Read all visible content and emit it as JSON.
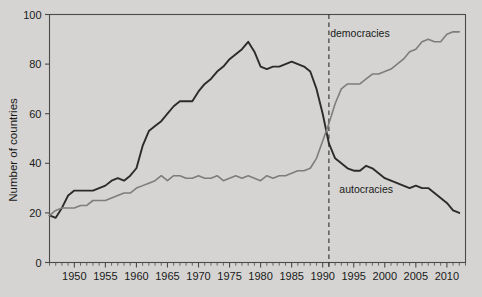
{
  "chart_data": {
    "type": "line",
    "title": "",
    "subtitle": "",
    "xlabel": "",
    "ylabel": "Number of countries",
    "xlim": [
      1946,
      2013
    ],
    "ylim": [
      0,
      100
    ],
    "grid": false,
    "legend_position": "inline-annotation",
    "y_ticks": [
      0,
      20,
      40,
      60,
      80,
      100
    ],
    "y_tick_labels": [
      "0",
      "20",
      "40",
      "60",
      "80",
      "100"
    ],
    "x_ticks": [
      1950,
      1955,
      1960,
      1965,
      1970,
      1975,
      1980,
      1985,
      1990,
      1995,
      2000,
      2005,
      2010
    ],
    "x_tick_labels": [
      "1950",
      "1955",
      "1960",
      "1965",
      "1970",
      "1975",
      "1980",
      "1985",
      "1990",
      "1995",
      "2000",
      "2005",
      "2010"
    ],
    "x_minor_tick_step": 1,
    "annotations": [
      {
        "name": "fall-of-berlin-wall-marker",
        "type": "vline",
        "x": 1991,
        "style": "dashed",
        "color": "#2b2b2b",
        "label": ""
      }
    ],
    "series": [
      {
        "name": "autocracies",
        "label": "autocracies",
        "color": "#2b2b2b",
        "label_x": 1997,
        "label_y": 28,
        "x": [
          1946,
          1947,
          1948,
          1949,
          1950,
          1951,
          1952,
          1953,
          1954,
          1955,
          1956,
          1957,
          1958,
          1959,
          1960,
          1961,
          1962,
          1963,
          1964,
          1965,
          1966,
          1967,
          1968,
          1969,
          1970,
          1971,
          1972,
          1973,
          1974,
          1975,
          1976,
          1977,
          1978,
          1979,
          1980,
          1981,
          1982,
          1983,
          1984,
          1985,
          1986,
          1987,
          1988,
          1989,
          1990,
          1991,
          1992,
          1993,
          1994,
          1995,
          1996,
          1997,
          1998,
          1999,
          2000,
          2001,
          2002,
          2003,
          2004,
          2005,
          2006,
          2007,
          2008,
          2009,
          2010,
          2011,
          2012
        ],
        "values": [
          19,
          18,
          22,
          27,
          29,
          29,
          29,
          29,
          30,
          31,
          33,
          34,
          33,
          35,
          38,
          47,
          53,
          55,
          57,
          60,
          63,
          65,
          65,
          65,
          69,
          72,
          74,
          77,
          79,
          82,
          84,
          86,
          89,
          85,
          79,
          78,
          79,
          79,
          80,
          81,
          80,
          79,
          77,
          70,
          60,
          48,
          42,
          40,
          38,
          37,
          37,
          39,
          38,
          36,
          34,
          33,
          32,
          31,
          30,
          31,
          30,
          30,
          28,
          26,
          24,
          21,
          20
        ]
      },
      {
        "name": "democracies",
        "label": "democracies",
        "color": "#7d7d7d",
        "label_x": 1996,
        "label_y": 91,
        "x": [
          1946,
          1947,
          1948,
          1949,
          1950,
          1951,
          1952,
          1953,
          1954,
          1955,
          1956,
          1957,
          1958,
          1959,
          1960,
          1961,
          1962,
          1963,
          1964,
          1965,
          1966,
          1967,
          1968,
          1969,
          1970,
          1971,
          1972,
          1973,
          1974,
          1975,
          1976,
          1977,
          1978,
          1979,
          1980,
          1981,
          1982,
          1983,
          1984,
          1985,
          1986,
          1987,
          1988,
          1989,
          1990,
          1991,
          1992,
          1993,
          1994,
          1995,
          1996,
          1997,
          1998,
          1999,
          2000,
          2001,
          2002,
          2003,
          2004,
          2005,
          2006,
          2007,
          2008,
          2009,
          2010,
          2011,
          2012
        ],
        "values": [
          19,
          21,
          22,
          22,
          22,
          23,
          23,
          25,
          25,
          25,
          26,
          27,
          28,
          28,
          30,
          31,
          32,
          33,
          35,
          33,
          35,
          35,
          34,
          34,
          35,
          34,
          34,
          35,
          33,
          34,
          35,
          34,
          35,
          34,
          33,
          35,
          34,
          35,
          35,
          36,
          37,
          37,
          38,
          42,
          49,
          56,
          64,
          70,
          72,
          72,
          72,
          74,
          76,
          76,
          77,
          78,
          80,
          82,
          85,
          86,
          89,
          90,
          89,
          89,
          92,
          93,
          93
        ]
      }
    ]
  },
  "labels": {
    "y_axis_title": "Number of countries",
    "democracies": "democracies",
    "autocracies": "autocracies"
  },
  "colors": {
    "background": "#d5d4d2",
    "plot_background": "#d5d4d2",
    "frame": "#4a4a4a",
    "autocracies_line": "#2b2b2b",
    "democracies_line": "#7d7d7d",
    "marker_line": "#2b2b2b",
    "text": "#1a1a1a"
  }
}
